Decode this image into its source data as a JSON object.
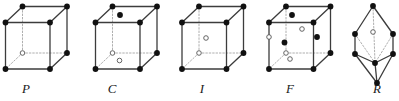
{
  "figure": {
    "background_color": "#ffffff",
    "line_color": "#4a4a4a",
    "solid_edge_color": "#3c3c3c",
    "dashed_edge_color": "#9a9a9a",
    "filled_node_color": "#111111",
    "open_node_fill": "#ffffff",
    "open_node_stroke": "#555555",
    "label_color": "#1a1a1a"
  },
  "cells": [
    {
      "id": "cell-p",
      "label": "P",
      "label_x": 26,
      "label_y": 93,
      "type": "cube",
      "origin": {
        "x": 5.5,
        "y": 22.5
      },
      "width": 44.5,
      "height": 46.5,
      "depth_dx": 17,
      "depth_dy": -16,
      "interior_points": []
    },
    {
      "id": "cell-c",
      "label": "C",
      "label_x": 112,
      "label_y": 93,
      "type": "cube",
      "origin": {
        "x": 95.5,
        "y": 22.5
      },
      "width": 44.5,
      "height": 46.5,
      "depth_dx": 17,
      "depth_dy": -16,
      "interior_points": [
        {
          "name": "top-face-center",
          "x": 120,
          "y": 15,
          "style": "filled"
        },
        {
          "name": "bottom-face-center",
          "x": 119.5,
          "y": 60.5,
          "style": "open"
        }
      ]
    },
    {
      "id": "cell-i",
      "label": "I",
      "label_x": 202,
      "label_y": 93,
      "type": "cube",
      "origin": {
        "x": 182,
        "y": 22.5
      },
      "width": 44.5,
      "height": 46.5,
      "depth_dx": 17,
      "depth_dy": -16,
      "interior_points": [
        {
          "name": "body-center",
          "x": 206,
          "y": 38,
          "style": "open"
        }
      ]
    },
    {
      "id": "cell-f",
      "label": "F",
      "label_x": 290,
      "label_y": 93,
      "type": "cube",
      "origin": {
        "x": 269,
        "y": 22.5
      },
      "width": 44.5,
      "height": 46.5,
      "depth_dx": 17,
      "depth_dy": -16,
      "interior_points": [
        {
          "name": "top-face-center",
          "x": 292,
          "y": 15,
          "style": "filled"
        },
        {
          "name": "back-face-center",
          "x": 302,
          "y": 29,
          "style": "open"
        },
        {
          "name": "right-face-center",
          "x": 317,
          "y": 37,
          "style": "filled"
        },
        {
          "name": "left-face-center",
          "x": 269,
          "y": 37,
          "style": "open"
        },
        {
          "name": "front-face-center",
          "x": 284.5,
          "y": 42.5,
          "style": "filled"
        },
        {
          "name": "bottom-face-center",
          "x": 290,
          "y": 59,
          "style": "open"
        }
      ]
    },
    {
      "id": "cell-r",
      "label": "R",
      "label_x": 377,
      "label_y": 93,
      "type": "rhombohedron",
      "vertices": [
        {
          "name": "top-apex",
          "x": 373,
          "y": 6,
          "style": "filled"
        },
        {
          "name": "upper-left",
          "x": 355,
          "y": 34,
          "style": "filled"
        },
        {
          "name": "upper-right",
          "x": 393,
          "y": 34,
          "style": "filled"
        },
        {
          "name": "lower-left",
          "x": 355,
          "y": 54,
          "style": "filled"
        },
        {
          "name": "lower-right",
          "x": 393,
          "y": 54,
          "style": "filled"
        },
        {
          "name": "front-middle",
          "x": 375,
          "y": 63,
          "style": "filled"
        },
        {
          "name": "bottom-apex",
          "x": 377,
          "y": 83,
          "style": "filled"
        },
        {
          "name": "body-center",
          "x": 373,
          "y": 32,
          "style": "open"
        }
      ]
    }
  ]
}
